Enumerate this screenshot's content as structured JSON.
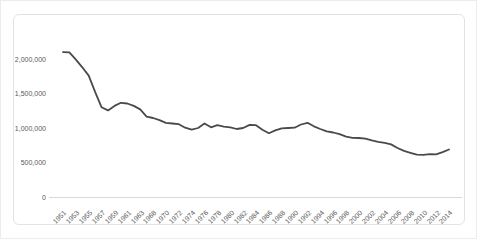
{
  "chart_data": {
    "type": "line",
    "title": "",
    "xlabel": "",
    "ylabel": "",
    "grid": false,
    "legend": false,
    "ylim": [
      0,
      2000000
    ],
    "yticks": [
      0,
      500000,
      1000000,
      1500000,
      2000000
    ],
    "ytick_labels": [
      "0",
      "500,000",
      "1,000,000",
      "1,500,000",
      "2,000,000"
    ],
    "visible_x_tick_labels": [
      "1951",
      "1953",
      "1955",
      "1957",
      "1959",
      "1961",
      "1963",
      "1968",
      "1970",
      "1972",
      "1974",
      "1976",
      "1978",
      "1980",
      "1982",
      "1984",
      "1986",
      "1988",
      "1990",
      "1992",
      "1994",
      "1996",
      "1998",
      "2000",
      "2002",
      "2004",
      "2006",
      "2008",
      "2010",
      "2012",
      "2014"
    ],
    "categories": [
      "1951",
      "1952",
      "1953",
      "1954",
      "1955",
      "1956",
      "1957",
      "1958",
      "1959",
      "1960",
      "1961",
      "1962",
      "1963",
      "1964",
      "1968",
      "1969",
      "1970",
      "1971",
      "1972",
      "1973",
      "1974",
      "1975",
      "1976",
      "1977",
      "1978",
      "1979",
      "1980",
      "1981",
      "1982",
      "1983",
      "1984",
      "1985",
      "1986",
      "1987",
      "1988",
      "1989",
      "1990",
      "1991",
      "1992",
      "1993",
      "1994",
      "1995",
      "1996",
      "1997",
      "1998",
      "1999",
      "2000",
      "2001",
      "2002",
      "2003",
      "2004",
      "2005",
      "2006",
      "2007",
      "2008",
      "2009",
      "2010",
      "2011",
      "2012",
      "2013",
      "2014"
    ],
    "series": [
      {
        "name": "value",
        "values": [
          2100000,
          2095000,
          1990000,
          1880000,
          1760000,
          1520000,
          1300000,
          1255000,
          1320000,
          1365000,
          1355000,
          1320000,
          1270000,
          1165000,
          1145000,
          1115000,
          1075000,
          1065000,
          1055000,
          1005000,
          975000,
          1000000,
          1065000,
          1010000,
          1040000,
          1020000,
          1010000,
          985000,
          1000000,
          1045000,
          1040000,
          975000,
          925000,
          965000,
          995000,
          1000000,
          1005000,
          1050000,
          1075000,
          1025000,
          985000,
          950000,
          935000,
          910000,
          875000,
          858000,
          855000,
          845000,
          820000,
          800000,
          785000,
          762000,
          710000,
          668000,
          640000,
          615000,
          612000,
          620000,
          617000,
          650000,
          688000
        ]
      }
    ],
    "colors": {
      "line": "#4a4a4a",
      "axis_line": "#d9d9d9",
      "tick_label": "#595959",
      "chart_border": "#e3e3e3",
      "background": "#ffffff"
    }
  }
}
